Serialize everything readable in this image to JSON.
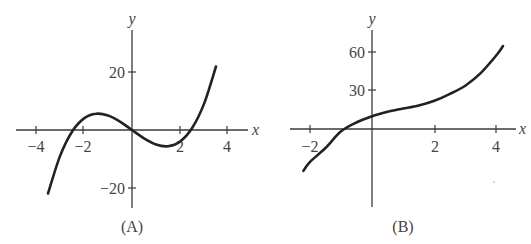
{
  "panels": [
    {
      "caption": "(A)",
      "x_label": "x",
      "y_label": "y",
      "x_ticks": [
        "−4",
        "−2",
        "2",
        "4"
      ],
      "y_ticks": [
        "20",
        "−20"
      ]
    },
    {
      "caption": "(B)",
      "x_label": "x",
      "y_label": "y",
      "x_ticks": [
        "−2",
        "2",
        "4"
      ],
      "y_ticks": [
        "60",
        "30"
      ]
    }
  ],
  "chart_data": [
    {
      "type": "line",
      "title": "(A)",
      "xlabel": "x",
      "ylabel": "y",
      "xlim": [
        -4.5,
        5
      ],
      "ylim": [
        -25,
        30
      ],
      "x_ticks": [
        -4,
        -2,
        2,
        4
      ],
      "y_ticks": [
        -20,
        20
      ],
      "grid": false,
      "series": [
        {
          "name": "curve A",
          "x": [
            -3.5,
            -3,
            -2.5,
            -2,
            -1.5,
            -1,
            -0.5,
            0,
            0.5,
            1,
            1.5,
            2,
            2.5,
            3,
            3.5
          ],
          "values": [
            -21.9,
            -9,
            -0.6,
            4,
            5.6,
            5,
            2.9,
            0,
            -2.9,
            -5,
            -5.6,
            -4,
            0.6,
            9,
            21.9
          ]
        }
      ]
    },
    {
      "type": "line",
      "title": "(B)",
      "xlabel": "x",
      "ylabel": "y",
      "xlim": [
        -2.5,
        4.8
      ],
      "ylim": [
        -45,
        75
      ],
      "x_ticks": [
        -2,
        2,
        4
      ],
      "y_ticks": [
        30,
        60
      ],
      "grid": false,
      "series": [
        {
          "name": "curve B",
          "x": [
            -2.2,
            -2,
            -1.5,
            -1,
            -0.5,
            0,
            0.5,
            1,
            1.5,
            2,
            2.5,
            3,
            3.5,
            4,
            4.2
          ],
          "values": [
            -32.7,
            -26,
            -15.1,
            -2,
            5.1,
            10,
            13.4,
            16,
            18.4,
            22,
            27.4,
            34,
            44.1,
            58,
            64.8
          ]
        }
      ]
    }
  ]
}
